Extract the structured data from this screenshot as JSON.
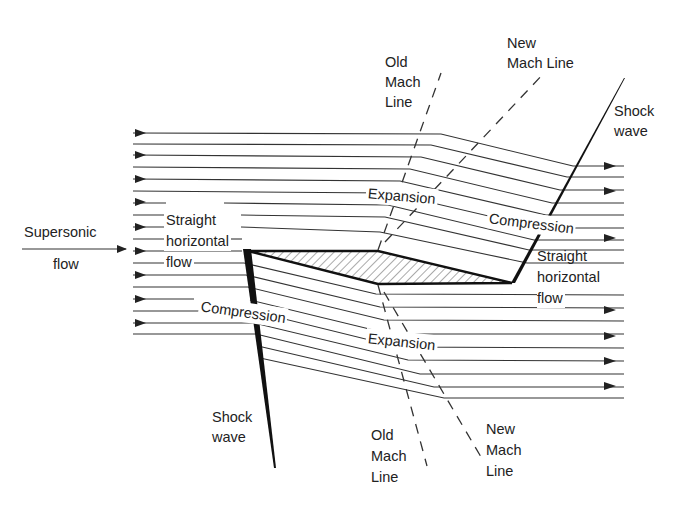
{
  "diagram": {
    "type": "supersonic-flow-over-diamond-airfoil",
    "labels": {
      "supersonic": "Supersonic",
      "flow_left": "flow",
      "straight_left": "Straight",
      "horizontal_left": "horizontal",
      "flow_left_inner": "flow",
      "expansion_top": "Expansion",
      "compression_top": "Compression",
      "straight_right": "Straight",
      "horizontal_right": "horizontal",
      "flow_right": "flow",
      "compression_bottom": "Compression",
      "expansion_bottom": "Expansion",
      "old_mach_top_1": "Old",
      "old_mach_top_2": "Mach",
      "old_mach_top_3": "Line",
      "new_mach_top_1": "New",
      "new_mach_top_2": "Mach Line",
      "shock_top_1": "Shock",
      "shock_top_2": "wave",
      "shock_bottom_1": "Shock",
      "shock_bottom_2": "wave",
      "old_mach_bottom_1": "Old",
      "old_mach_bottom_2": "Mach",
      "old_mach_bottom_3": "Line",
      "new_mach_bottom_1": "New",
      "new_mach_bottom_2": "Mach",
      "new_mach_bottom_3": "Line"
    },
    "colors": {
      "line": "#333333",
      "shock": "#111111",
      "hatch": "#555555",
      "background": "#ffffff"
    }
  }
}
